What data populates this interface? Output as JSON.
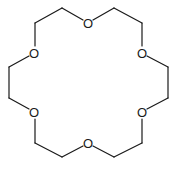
{
  "diagram": {
    "type": "chemical-structure",
    "name": "18-crown-6",
    "atom_label": "O",
    "atoms": [
      {
        "id": "O1",
        "label": "O",
        "x": 88,
        "y": 23
      },
      {
        "id": "O2",
        "label": "O",
        "x": 142,
        "y": 53
      },
      {
        "id": "O3",
        "label": "O",
        "x": 142,
        "y": 112
      },
      {
        "id": "O4",
        "label": "O",
        "x": 88,
        "y": 143
      },
      {
        "id": "O5",
        "label": "O",
        "x": 34,
        "y": 112
      },
      {
        "id": "O6",
        "label": "O",
        "x": 34,
        "y": 53
      }
    ],
    "ring_path": [
      [
        88,
        23
      ],
      [
        114,
        8
      ],
      [
        142,
        23
      ],
      [
        142,
        53
      ],
      [
        168,
        67
      ],
      [
        168,
        98
      ],
      [
        142,
        112
      ],
      [
        142,
        143
      ],
      [
        114,
        157
      ],
      [
        88,
        143
      ],
      [
        62,
        157
      ],
      [
        35,
        143
      ],
      [
        34,
        112
      ],
      [
        9,
        98
      ],
      [
        9,
        67
      ],
      [
        34,
        53
      ],
      [
        35,
        23
      ],
      [
        62,
        8
      ],
      [
        88,
        23
      ]
    ],
    "bond_color": "#1a1a1a"
  }
}
